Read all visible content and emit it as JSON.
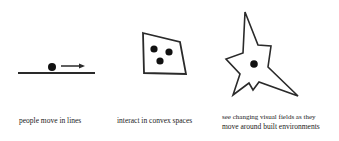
{
  "panels": [
    {
      "id": "lines",
      "caption": "people move in lines",
      "icon": "person-moving-along-line"
    },
    {
      "id": "convex",
      "caption": "interact in convex spaces",
      "icon": "people-in-convex-space"
    },
    {
      "id": "visual-fields",
      "caption_line1": "see changing visual fields as they",
      "caption_line2": "move around built environments",
      "icon": "isovist-star"
    }
  ],
  "colors": {
    "stroke": "#2a2a2a",
    "background": "#ffffff",
    "text": "#1a1a1a"
  }
}
